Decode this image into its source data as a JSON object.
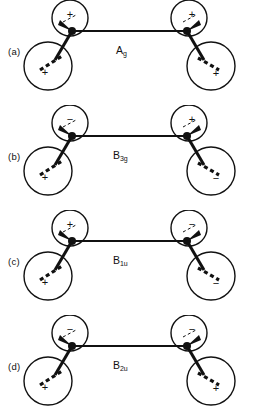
{
  "figure": {
    "background": "#ffffff",
    "stroke_color": "#111111",
    "rows": [
      {
        "row_label": "(a)",
        "symmetry": {
          "letter": "A",
          "subscript": "g"
        },
        "left_center": {
          "top_lobe_sign": "+",
          "bottom_lobe_sign": "+"
        },
        "right_center": {
          "top_lobe_sign": "+",
          "bottom_lobe_sign": "+"
        }
      },
      {
        "row_label": "(b)",
        "symmetry": {
          "letter": "B",
          "subscript": "3g"
        },
        "left_center": {
          "top_lobe_sign": "−",
          "bottom_lobe_sign": "+"
        },
        "right_center": {
          "top_lobe_sign": "+",
          "bottom_lobe_sign": "−"
        }
      },
      {
        "row_label": "(c)",
        "symmetry": {
          "letter": "B",
          "subscript": "1u"
        },
        "left_center": {
          "top_lobe_sign": "+",
          "bottom_lobe_sign": "+"
        },
        "right_center": {
          "top_lobe_sign": "−",
          "bottom_lobe_sign": "−"
        }
      },
      {
        "row_label": "(d)",
        "symmetry": {
          "letter": "B",
          "subscript": "2u"
        },
        "left_center": {
          "top_lobe_sign": "−",
          "bottom_lobe_sign": "+"
        },
        "right_center": {
          "top_lobe_sign": "−",
          "bottom_lobe_sign": "+"
        }
      }
    ]
  }
}
